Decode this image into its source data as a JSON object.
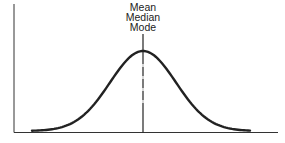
{
  "chart_data": {
    "type": "line",
    "title": "",
    "xlabel": "",
    "ylabel": "",
    "annotation": {
      "lines": [
        "Mean",
        "Median",
        "Mode"
      ],
      "position": "center peak"
    },
    "series": [
      {
        "name": "Normal distribution",
        "x": [
          -3,
          -2.5,
          -2,
          -1.5,
          -1,
          -0.5,
          0,
          0.5,
          1,
          1.5,
          2,
          2.5,
          3
        ],
        "values": [
          0.004,
          0.018,
          0.054,
          0.13,
          0.242,
          0.352,
          0.399,
          0.352,
          0.242,
          0.13,
          0.054,
          0.018,
          0.004
        ]
      }
    ],
    "grid": false,
    "legend": false,
    "ticks": false
  },
  "labels": {
    "line1": "Mean",
    "line2": "Median",
    "line3": "Mode"
  },
  "colors": {
    "curve": "#222222",
    "axes": "#333333"
  }
}
